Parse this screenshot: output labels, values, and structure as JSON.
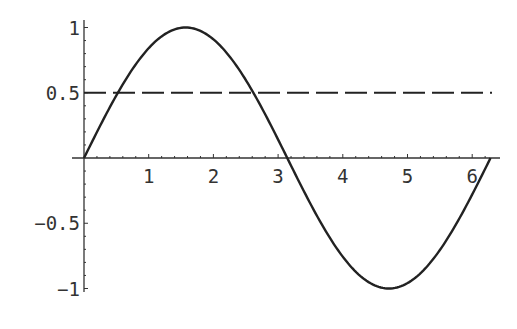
{
  "chart_data": {
    "type": "line",
    "title": "",
    "xlabel": "",
    "ylabel": "",
    "xlim": [
      0,
      6.2832
    ],
    "ylim": [
      -1,
      1
    ],
    "grid": false,
    "legend": null,
    "x_ticks": [
      "1",
      "2",
      "3",
      "4",
      "5",
      "6"
    ],
    "y_ticks": [
      "1",
      "0.5",
      "-0.5",
      "-1"
    ],
    "series": [
      {
        "name": "sin(x)",
        "style": "solid",
        "x": [
          0,
          0.5236,
          1.0472,
          1.5708,
          2.0944,
          2.618,
          3.1416,
          3.6652,
          4.1888,
          4.7124,
          5.236,
          5.7596,
          6.2832
        ],
        "values": [
          0,
          0.5,
          0.866,
          1,
          0.866,
          0.5,
          0,
          -0.5,
          -0.866,
          -1,
          -0.866,
          -0.5,
          0
        ]
      },
      {
        "name": "y = 0.5",
        "style": "dashed",
        "x": [
          0,
          6.2832
        ],
        "values": [
          0.5,
          0.5
        ]
      }
    ],
    "colors": {
      "curve": "#222222",
      "axes": "#333333"
    }
  }
}
